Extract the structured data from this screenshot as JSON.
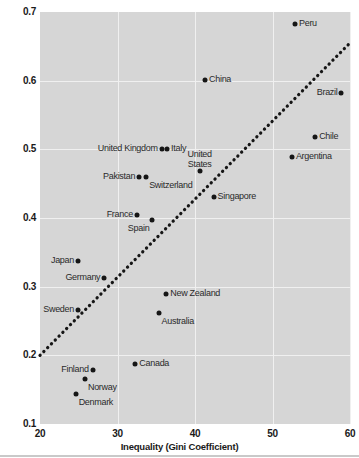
{
  "chart_data": {
    "type": "scatter",
    "title": "",
    "xlabel": "Inequality (Gini Coefficient)",
    "ylabel": "Intergenerational Earnings Elasticity",
    "xlim": [
      20,
      60
    ],
    "ylim": [
      0.1,
      0.7
    ],
    "xticks": [
      "20",
      "30",
      "40",
      "50",
      "60"
    ],
    "xtick_values": [
      20,
      30,
      40,
      50,
      60
    ],
    "yticks": [
      "0.7",
      "0.6",
      "0.5",
      "0.4",
      "0.3",
      "0.2",
      "0.1"
    ],
    "ytick_values": [
      0.7,
      0.6,
      0.5,
      0.4,
      0.3,
      0.2,
      0.1
    ],
    "grid": true,
    "legend": "none",
    "plot_bgcolor": "#d6d6d6",
    "gridline_color": "#f0f0f0",
    "point_color": "#161616",
    "trendline": {
      "style": "dotted",
      "color": "#161616",
      "x": [
        20,
        60
      ],
      "y": [
        0.2,
        0.655
      ]
    },
    "points": [
      {
        "label": "Peru",
        "x": 52.9,
        "y": 0.682,
        "label_pos": "right"
      },
      {
        "label": "Brazil",
        "x": 58.9,
        "y": 0.582,
        "label_pos": "left"
      },
      {
        "label": "China",
        "x": 41.3,
        "y": 0.601,
        "label_pos": "right"
      },
      {
        "label": "Chile",
        "x": 55.5,
        "y": 0.518,
        "label_pos": "right"
      },
      {
        "label": "Argentina",
        "x": 52.5,
        "y": 0.489,
        "label_pos": "right"
      },
      {
        "label": "United Kingdom",
        "x": 35.7,
        "y": 0.5,
        "label_pos": "left"
      },
      {
        "label": "Italy",
        "x": 36.4,
        "y": 0.5,
        "label_pos": "right"
      },
      {
        "label": "United States",
        "x": 40.6,
        "y": 0.468,
        "label_pos": "above"
      },
      {
        "label": "Pakistan",
        "x": 32.8,
        "y": 0.459,
        "label_pos": "left"
      },
      {
        "label": "Switzerland",
        "x": 33.7,
        "y": 0.459,
        "label_pos": "below-right"
      },
      {
        "label": "Singapore",
        "x": 42.4,
        "y": 0.43,
        "label_pos": "right"
      },
      {
        "label": "France",
        "x": 32.5,
        "y": 0.404,
        "label_pos": "left"
      },
      {
        "label": "Spain",
        "x": 34.5,
        "y": 0.397,
        "label_pos": "below-left"
      },
      {
        "label": "Japan",
        "x": 24.9,
        "y": 0.337,
        "label_pos": "left"
      },
      {
        "label": "Germany",
        "x": 28.3,
        "y": 0.313,
        "label_pos": "left"
      },
      {
        "label": "New Zealand",
        "x": 36.3,
        "y": 0.289,
        "label_pos": "right"
      },
      {
        "label": "Australia",
        "x": 35.3,
        "y": 0.261,
        "label_pos": "below-right"
      },
      {
        "label": "Sweden",
        "x": 24.9,
        "y": 0.266,
        "label_pos": "left"
      },
      {
        "label": "Canada",
        "x": 32.3,
        "y": 0.187,
        "label_pos": "right"
      },
      {
        "label": "Finland",
        "x": 26.8,
        "y": 0.178,
        "label_pos": "left"
      },
      {
        "label": "Norway",
        "x": 25.8,
        "y": 0.166,
        "label_pos": "below-right"
      },
      {
        "label": "Denmark",
        "x": 24.6,
        "y": 0.143,
        "label_pos": "below-right"
      }
    ]
  }
}
